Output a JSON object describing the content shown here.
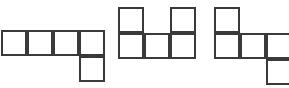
{
  "canvas": {
    "width": 289,
    "height": 88,
    "background_color": "#ffffff",
    "line_color": "#3a3a3a",
    "line_width": 2,
    "cell_size": 26
  },
  "chart_data": {
    "type": "diagram",
    "title": "",
    "subtitle": "",
    "grid_unit_px": 26,
    "figures": [
      {
        "id": "figure-1",
        "name": "L-pentomino-net",
        "origin_px": {
          "x": 1,
          "y": 30
        },
        "cells_wide": 4,
        "cells_tall": 2,
        "cell_count": 5,
        "cells": [
          {
            "col": 0,
            "row": 0
          },
          {
            "col": 1,
            "row": 0
          },
          {
            "col": 2,
            "row": 0
          },
          {
            "col": 3,
            "row": 0
          },
          {
            "col": 3,
            "row": 1
          }
        ]
      },
      {
        "id": "figure-2",
        "name": "u-pentomino-net",
        "origin_px": {
          "x": 118,
          "y": 7
        },
        "cells_wide": 3,
        "cells_tall": 2,
        "cell_count": 5,
        "cells": [
          {
            "col": 0,
            "row": 0
          },
          {
            "col": 2,
            "row": 0
          },
          {
            "col": 0,
            "row": 1
          },
          {
            "col": 1,
            "row": 1
          },
          {
            "col": 2,
            "row": 1
          }
        ]
      },
      {
        "id": "figure-3",
        "name": "z-pentomino-net",
        "origin_px": {
          "x": 214,
          "y": 7
        },
        "cells_wide": 3,
        "cells_tall": 3,
        "cell_count": 5,
        "cells": [
          {
            "col": 0,
            "row": 0
          },
          {
            "col": 0,
            "row": 1
          },
          {
            "col": 1,
            "row": 1
          },
          {
            "col": 2,
            "row": 1
          },
          {
            "col": 2,
            "row": 2
          }
        ]
      }
    ],
    "labels": [],
    "legend": []
  }
}
